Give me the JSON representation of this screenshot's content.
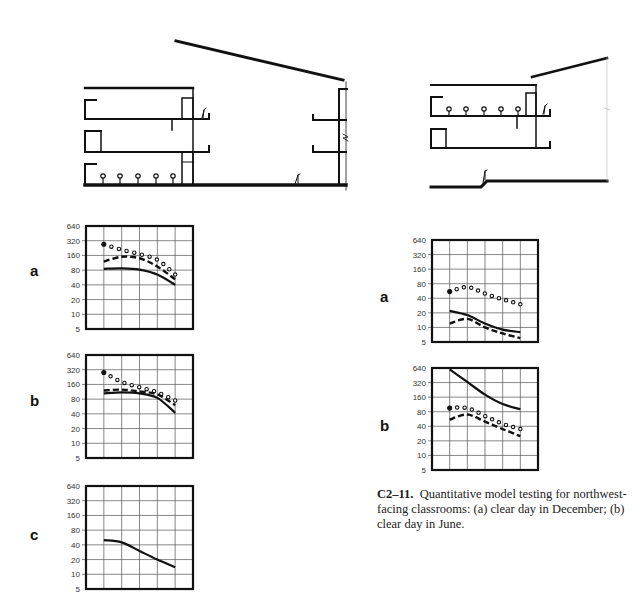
{
  "figure": {
    "caption_id": "C2–11.",
    "caption_text": "Quantitative model testing for northwest-facing classrooms: (a) clear day in December; (b) clear day in June."
  },
  "chart_data": [
    {
      "id": "left-a",
      "label": "a",
      "type": "line",
      "title": "",
      "xlabel": "",
      "ylabel": "",
      "y_scale": "log2",
      "yticks": [
        640,
        320,
        160,
        80,
        40,
        20,
        10,
        5
      ],
      "ylim": [
        5,
        640
      ],
      "grid": true,
      "grid_columns": 6,
      "x": [
        1,
        2,
        3,
        4,
        5
      ],
      "series": [
        {
          "name": "dotted",
          "style": "dots",
          "values": [
            270,
            210,
            170,
            130,
            65
          ]
        },
        {
          "name": "dashed",
          "style": "dashed",
          "values": [
            120,
            150,
            140,
            95,
            52
          ]
        },
        {
          "name": "solid",
          "style": "solid",
          "values": [
            85,
            87,
            82,
            65,
            40
          ]
        }
      ]
    },
    {
      "id": "left-b",
      "label": "b",
      "type": "line",
      "y_scale": "log2",
      "yticks": [
        640,
        320,
        160,
        80,
        40,
        20,
        10,
        5
      ],
      "ylim": [
        5,
        640
      ],
      "grid": true,
      "grid_columns": 6,
      "x": [
        1,
        2,
        3,
        4,
        5
      ],
      "series": [
        {
          "name": "dotted",
          "style": "dots",
          "values": [
            280,
            180,
            140,
            110,
            75
          ]
        },
        {
          "name": "dashed",
          "style": "dashed",
          "values": [
            120,
            125,
            115,
            100,
            60
          ]
        },
        {
          "name": "solid",
          "style": "solid",
          "values": [
            105,
            110,
            105,
            85,
            42
          ]
        }
      ]
    },
    {
      "id": "left-c",
      "label": "c",
      "type": "line",
      "y_scale": "log2",
      "yticks": [
        640,
        320,
        160,
        80,
        40,
        20,
        10,
        5
      ],
      "ylim": [
        5,
        640
      ],
      "grid": true,
      "grid_columns": 6,
      "x": [
        1,
        2,
        3,
        4,
        5
      ],
      "series": [
        {
          "name": "solid",
          "style": "solid",
          "values": [
            50,
            45,
            30,
            20,
            14
          ]
        }
      ]
    },
    {
      "id": "right-a",
      "label": "a",
      "type": "line",
      "y_scale": "log2",
      "yticks": [
        640,
        320,
        160,
        80,
        40,
        20,
        10,
        5
      ],
      "ylim": [
        5,
        640
      ],
      "grid": true,
      "grid_columns": 6,
      "x": [
        1,
        2,
        3,
        4,
        5
      ],
      "series": [
        {
          "name": "dotted",
          "style": "dots",
          "values": [
            55,
            68,
            50,
            38,
            30
          ]
        },
        {
          "name": "solid",
          "style": "solid",
          "values": [
            22,
            18,
            12,
            9,
            8
          ]
        },
        {
          "name": "dashed",
          "style": "dashed",
          "values": [
            12,
            15,
            10,
            7.5,
            6
          ]
        }
      ]
    },
    {
      "id": "right-b",
      "label": "b",
      "type": "line",
      "y_scale": "log2",
      "yticks": [
        640,
        320,
        160,
        80,
        40,
        20,
        10,
        5
      ],
      "ylim": [
        5,
        640
      ],
      "grid": true,
      "grid_columns": 6,
      "x": [
        1,
        2,
        3,
        4,
        5
      ],
      "series": [
        {
          "name": "solid",
          "style": "solid",
          "values": [
            600,
            330,
            180,
            115,
            90
          ]
        },
        {
          "name": "dotted",
          "style": "dots",
          "values": [
            95,
            95,
            65,
            45,
            35
          ]
        },
        {
          "name": "dashed",
          "style": "dashed",
          "values": [
            55,
            70,
            50,
            35,
            25
          ]
        }
      ]
    }
  ],
  "layout": {
    "charts": {
      "left-a": {
        "x": 86,
        "y": 226,
        "w": 107,
        "h": 103,
        "labelX": 30,
        "labelY": 262
      },
      "left-b": {
        "x": 86,
        "y": 355,
        "w": 107,
        "h": 103,
        "labelX": 30,
        "labelY": 392
      },
      "left-c": {
        "x": 86,
        "y": 486,
        "w": 107,
        "h": 103,
        "labelX": 30,
        "labelY": 526
      },
      "right-a": {
        "x": 432,
        "y": 240,
        "w": 106,
        "h": 102,
        "labelX": 380,
        "labelY": 288
      },
      "right-b": {
        "x": 432,
        "y": 368,
        "w": 106,
        "h": 102,
        "labelX": 380,
        "labelY": 417
      }
    }
  }
}
